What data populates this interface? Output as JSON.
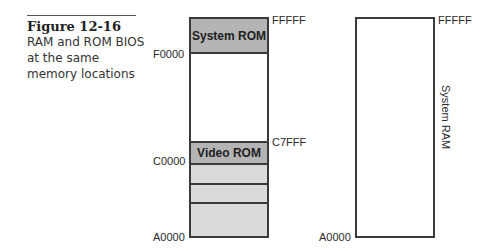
{
  "caption": {
    "title": "Figure 12-16",
    "body": "RAM and ROM BIOS at the same memory locations"
  },
  "left_map": {
    "regions": [
      {
        "label": "System ROM",
        "start": "F0000",
        "end": "FFFFF",
        "fill": "#b4b4b4"
      },
      {
        "label": "",
        "start": "C8000",
        "end": "EFFFF",
        "fill": "#ffffff"
      },
      {
        "label": "Video ROM",
        "start": "C0000",
        "end": "C7FFF",
        "fill": "#b4b4b4"
      },
      {
        "label": "",
        "start": "A0000",
        "end": "BFFFF",
        "fill": "#dadada"
      }
    ],
    "addresses": {
      "top_right": "FFFFF",
      "f0000": "F0000",
      "c7fff": "C7FFF",
      "c0000": "C0000",
      "a0000": "A0000"
    }
  },
  "right_map": {
    "label": "System RAM",
    "addresses": {
      "top_right": "FFFFF",
      "bottom_left": "A0000"
    }
  },
  "colors": {
    "rom_fill": "#b4b4b4",
    "light_fill": "#dadada",
    "outline": "#3a3a3a"
  }
}
